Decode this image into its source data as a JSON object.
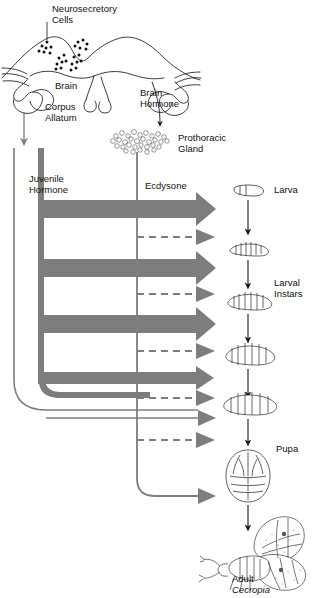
{
  "figure": {
    "colors": {
      "hormone_gray": "#7d7d7d",
      "outline_black": "#1a1a1a",
      "background": "#ffffff"
    }
  },
  "labels": {
    "neurosecretory_cells": "Neurosecretory\nCells",
    "brain": "Brain",
    "corpus_allatum": "Corpus\nAllatum",
    "brain_hormone": "Brain\nHormone",
    "prothoracic_gland": "Prothoracic\nGland",
    "juvenile_hormone": "Juvenile\nHormone",
    "ecdysone": "Ecdysone",
    "larva": "Larva",
    "larval_instars": "Larval\nInstars",
    "pupa": "Pupa",
    "adult": "Adult",
    "adult_species": "Cecropia"
  },
  "stages": [
    {
      "name": "larva",
      "label": "Larva",
      "y": 192
    },
    {
      "name": "instar-2",
      "label": "",
      "y": 247
    },
    {
      "name": "instar-3",
      "label": "",
      "y": 288
    },
    {
      "name": "instar-4",
      "label": "Larval Instars",
      "y": 337
    },
    {
      "name": "instar-5",
      "label": "",
      "y": 389
    },
    {
      "name": "pupa",
      "label": "Pupa",
      "y": 447
    },
    {
      "name": "adult",
      "label": "Adult Cecropia",
      "y": 538
    }
  ],
  "hormone_arrows": [
    {
      "index": 0,
      "type": "juvenile-hormone-thick",
      "y": 208,
      "style": "solid-thick"
    },
    {
      "index": 1,
      "type": "ecdysone-dashed",
      "y": 232,
      "style": "dashed"
    },
    {
      "index": 2,
      "type": "juvenile-hormone-thick",
      "y": 267,
      "style": "solid-thick"
    },
    {
      "index": 3,
      "type": "ecdysone-dashed",
      "y": 288,
      "style": "dashed"
    },
    {
      "index": 4,
      "type": "juvenile-hormone-thick",
      "y": 323,
      "style": "solid-thick"
    },
    {
      "index": 5,
      "type": "ecdysone-dashed",
      "y": 333,
      "style": "dashed"
    },
    {
      "index": 6,
      "type": "juvenile-hormone-medium",
      "y": 377,
      "style": "solid-medium"
    },
    {
      "index": 7,
      "type": "ecdysone-dashed",
      "y": 383,
      "style": "dashed"
    },
    {
      "index": 8,
      "type": "juvenile-hormone-thin",
      "y": 418,
      "style": "solid-thin"
    },
    {
      "index": 9,
      "type": "ecdysone-dashed",
      "y": 436,
      "style": "dashed"
    },
    {
      "index": 10,
      "type": "ecdysone-final",
      "y": 489,
      "style": "solid-thin"
    }
  ]
}
